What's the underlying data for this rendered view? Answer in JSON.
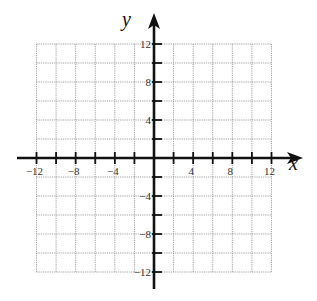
{
  "chart_data": {
    "type": "coordinate-grid",
    "title": "",
    "xlabel": "x",
    "ylabel": "y",
    "xlim": [
      -12,
      12
    ],
    "ylim": [
      -12,
      12
    ],
    "grid": true,
    "grid_step": 2,
    "tick_step": 2,
    "x_tick_labels": [
      "-12",
      "-8",
      "-4",
      "4",
      "8",
      "12"
    ],
    "x_tick_values": [
      -12,
      -8,
      -4,
      4,
      8,
      12
    ],
    "y_tick_labels": [
      "12",
      "8",
      "4",
      "-4",
      "-8",
      "-12"
    ],
    "y_tick_values": [
      12,
      8,
      4,
      -4,
      -8,
      -12
    ],
    "series": []
  },
  "colors": {
    "axis": "#111111",
    "grid": "#8a8a8a",
    "background": "#ffffff"
  }
}
